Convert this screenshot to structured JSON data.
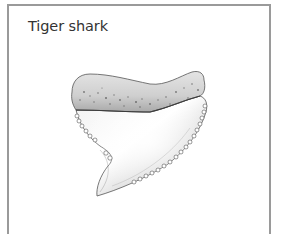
{
  "figure": {
    "caption": "Tiger shark",
    "illustration": "tiger-shark-tooth",
    "frame_color": "#9a9a9a",
    "text_color": "#333333"
  }
}
